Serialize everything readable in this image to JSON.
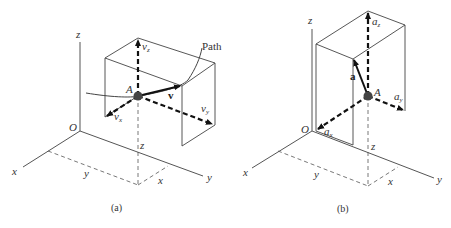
{
  "panels": [
    {
      "caption": "(a)",
      "axes": {
        "x": "x",
        "y": "y",
        "z": "z",
        "origin": "O"
      },
      "point": "A",
      "path_label": "Path",
      "vector": "v",
      "components": {
        "x": "v",
        "x_sub": "x",
        "y": "v",
        "y_sub": "y",
        "z": "v",
        "z_sub": "z"
      },
      "coords": {
        "x": "x",
        "y": "y",
        "z": "z"
      }
    },
    {
      "caption": "(b)",
      "axes": {
        "x": "x",
        "y": "y",
        "z": "z",
        "origin": "O"
      },
      "point": "A",
      "vector": "a",
      "components": {
        "x": "a",
        "x_sub": "x",
        "y": "a",
        "y_sub": "y",
        "z": "a",
        "z_sub": "z"
      },
      "coords": {
        "x": "x",
        "y": "y",
        "z": "z"
      }
    }
  ]
}
